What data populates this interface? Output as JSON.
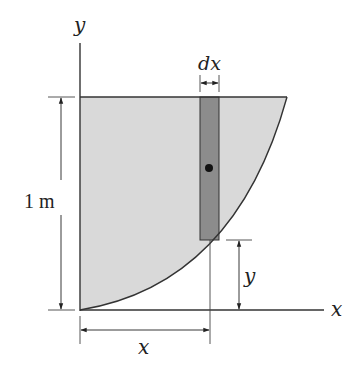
{
  "diagram": {
    "axes": {
      "y_label": "y",
      "x_label": "x"
    },
    "region": {
      "description": "Shaded area bounded by y-axis, top line y = 1 m, and parabolic curve from origin",
      "fill_color": "#d9d9d9",
      "height_label": "1 m"
    },
    "strip": {
      "width_label": "dx",
      "fill_color": "#8c8c8c",
      "centroid_marker": "dot"
    },
    "dimensions": {
      "strip_height_label": "y",
      "strip_position_label": "x"
    }
  }
}
